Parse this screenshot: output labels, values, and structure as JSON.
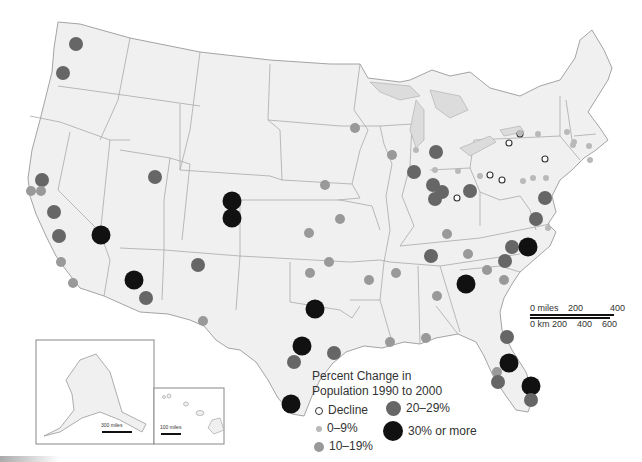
{
  "legend": {
    "title_line1": "Percent Change in",
    "title_line2": "Population 1990 to 2000",
    "items": [
      {
        "label": "Decline",
        "style": "hollow",
        "color": "#ffffff",
        "stroke": "#333333",
        "size": 7
      },
      {
        "label": "0–9%",
        "style": "filled",
        "color": "#b9b9b9",
        "size": 6
      },
      {
        "label": "10–19%",
        "style": "filled",
        "color": "#999999",
        "size": 10
      },
      {
        "label": "20–29%",
        "style": "filled",
        "color": "#666666",
        "size": 15
      },
      {
        "label": "30% or more",
        "style": "filled",
        "color": "#111111",
        "size": 20
      }
    ]
  },
  "scale": {
    "miles_labels": [
      "0 miles",
      "200",
      "400"
    ],
    "km_labels": [
      "0 km",
      "200",
      "400",
      "600"
    ]
  },
  "insets": {
    "alaska_scale": "300 miles",
    "hawaii_scale": "100 miles"
  },
  "colors": {
    "land": "#f0f0f0",
    "border": "#999999",
    "water": "#ffffff",
    "lakes": "#dcdcdc"
  },
  "cities": [
    {
      "x": 76,
      "y": 44,
      "cat": "20-29"
    },
    {
      "x": 63,
      "y": 73,
      "cat": "20-29"
    },
    {
      "x": 42,
      "y": 180,
      "cat": "20-29"
    },
    {
      "x": 31,
      "y": 191,
      "cat": "10-19"
    },
    {
      "x": 41,
      "y": 191,
      "cat": "10-19"
    },
    {
      "x": 54,
      "y": 212,
      "cat": "20-29"
    },
    {
      "x": 59,
      "y": 236,
      "cat": "20-29"
    },
    {
      "x": 101,
      "y": 235,
      "cat": "30+"
    },
    {
      "x": 61,
      "y": 262,
      "cat": "10-19"
    },
    {
      "x": 73,
      "y": 283,
      "cat": "10-19"
    },
    {
      "x": 155,
      "y": 177,
      "cat": "20-29"
    },
    {
      "x": 134,
      "y": 280,
      "cat": "30+"
    },
    {
      "x": 146,
      "y": 298,
      "cat": "20-29"
    },
    {
      "x": 198,
      "y": 265,
      "cat": "20-29"
    },
    {
      "x": 203,
      "y": 321,
      "cat": "10-19"
    },
    {
      "x": 232,
      "y": 201,
      "cat": "30+"
    },
    {
      "x": 232,
      "y": 218,
      "cat": "30+"
    },
    {
      "x": 325,
      "y": 185,
      "cat": "10-19"
    },
    {
      "x": 340,
      "y": 219,
      "cat": "10-19"
    },
    {
      "x": 309,
      "y": 233,
      "cat": "10-19"
    },
    {
      "x": 329,
      "y": 262,
      "cat": "10-19"
    },
    {
      "x": 310,
      "y": 273,
      "cat": "10-19"
    },
    {
      "x": 369,
      "y": 280,
      "cat": "10-19"
    },
    {
      "x": 315,
      "y": 309,
      "cat": "30+"
    },
    {
      "x": 302,
      "y": 346,
      "cat": "30+"
    },
    {
      "x": 294,
      "y": 362,
      "cat": "20-29"
    },
    {
      "x": 334,
      "y": 353,
      "cat": "20-29"
    },
    {
      "x": 291,
      "y": 404,
      "cat": "30+"
    },
    {
      "x": 355,
      "y": 128,
      "cat": "10-19"
    },
    {
      "x": 392,
      "y": 155,
      "cat": "10-19"
    },
    {
      "x": 414,
      "y": 171,
      "cat": "10-19"
    },
    {
      "x": 416,
      "y": 150,
      "cat": "0-9"
    },
    {
      "x": 436,
      "y": 152,
      "cat": "20-29"
    },
    {
      "x": 414,
      "y": 172,
      "cat": "20-29"
    },
    {
      "x": 433,
      "y": 185,
      "cat": "20-29"
    },
    {
      "x": 435,
      "y": 170,
      "cat": "0-9"
    },
    {
      "x": 442,
      "y": 192,
      "cat": "20-29"
    },
    {
      "x": 435,
      "y": 199,
      "cat": "20-29"
    },
    {
      "x": 457,
      "y": 198,
      "cat": "decline"
    },
    {
      "x": 470,
      "y": 191,
      "cat": "20-29"
    },
    {
      "x": 458,
      "y": 171,
      "cat": "0-9"
    },
    {
      "x": 480,
      "y": 176,
      "cat": "0-9"
    },
    {
      "x": 490,
      "y": 175,
      "cat": "decline"
    },
    {
      "x": 502,
      "y": 180,
      "cat": "decline"
    },
    {
      "x": 509,
      "y": 143,
      "cat": "decline"
    },
    {
      "x": 520,
      "y": 134,
      "cat": "decline"
    },
    {
      "x": 545,
      "y": 159,
      "cat": "decline"
    },
    {
      "x": 520,
      "y": 133,
      "cat": "0-9"
    },
    {
      "x": 538,
      "y": 134,
      "cat": "0-9"
    },
    {
      "x": 546,
      "y": 178,
      "cat": "0-9"
    },
    {
      "x": 533,
      "y": 178,
      "cat": "0-9"
    },
    {
      "x": 523,
      "y": 181,
      "cat": "0-9"
    },
    {
      "x": 567,
      "y": 132,
      "cat": "0-9"
    },
    {
      "x": 574,
      "y": 142,
      "cat": "0-9"
    },
    {
      "x": 573,
      "y": 145,
      "cat": "0-9"
    },
    {
      "x": 589,
      "y": 146,
      "cat": "0-9"
    },
    {
      "x": 590,
      "y": 160,
      "cat": "0-9"
    },
    {
      "x": 545,
      "y": 198,
      "cat": "20-29"
    },
    {
      "x": 536,
      "y": 219,
      "cat": "20-29"
    },
    {
      "x": 548,
      "y": 228,
      "cat": "0-9"
    },
    {
      "x": 447,
      "y": 234,
      "cat": "10-19"
    },
    {
      "x": 431,
      "y": 256,
      "cat": "20-29"
    },
    {
      "x": 468,
      "y": 254,
      "cat": "10-19"
    },
    {
      "x": 512,
      "y": 247,
      "cat": "20-29"
    },
    {
      "x": 528,
      "y": 247,
      "cat": "30+"
    },
    {
      "x": 505,
      "y": 261,
      "cat": "20-29"
    },
    {
      "x": 487,
      "y": 270,
      "cat": "10-19"
    },
    {
      "x": 504,
      "y": 280,
      "cat": "10-19"
    },
    {
      "x": 466,
      "y": 284,
      "cat": "30+"
    },
    {
      "x": 437,
      "y": 296,
      "cat": "10-19"
    },
    {
      "x": 396,
      "y": 273,
      "cat": "10-19"
    },
    {
      "x": 390,
      "y": 342,
      "cat": "10-19"
    },
    {
      "x": 426,
      "y": 338,
      "cat": "10-19"
    },
    {
      "x": 507,
      "y": 337,
      "cat": "20-29"
    },
    {
      "x": 509,
      "y": 363,
      "cat": "30+"
    },
    {
      "x": 497,
      "y": 372,
      "cat": "10-19"
    },
    {
      "x": 498,
      "y": 382,
      "cat": "20-29"
    },
    {
      "x": 531,
      "y": 386,
      "cat": "30+"
    },
    {
      "x": 531,
      "y": 400,
      "cat": "20-29"
    }
  ]
}
